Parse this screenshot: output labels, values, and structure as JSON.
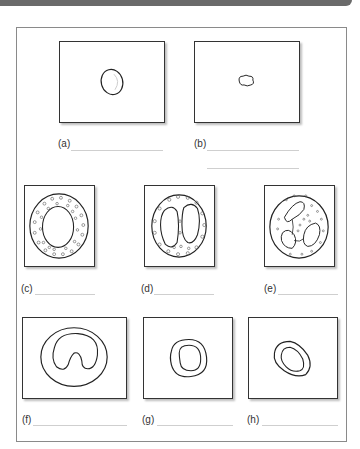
{
  "worksheet": {
    "panels": [
      {
        "id": "a",
        "label": "(a)",
        "cell": "small-round-cell"
      },
      {
        "id": "b",
        "label": "(b)",
        "cell": "irregular-platelet"
      },
      {
        "id": "c",
        "label": "(c)",
        "cell": "granular-round-nucleus-cell"
      },
      {
        "id": "d",
        "label": "(d)",
        "cell": "bilobed-nucleus-granular-cell"
      },
      {
        "id": "e",
        "label": "(e)",
        "cell": "multilobed-nucleus-cell"
      },
      {
        "id": "f",
        "label": "(f)",
        "cell": "kidney-nucleus-cell"
      },
      {
        "id": "g",
        "label": "(g)",
        "cell": "large-nucleus-small-cell"
      },
      {
        "id": "h",
        "label": "(h)",
        "cell": "oval-nucleus-cell"
      }
    ]
  }
}
